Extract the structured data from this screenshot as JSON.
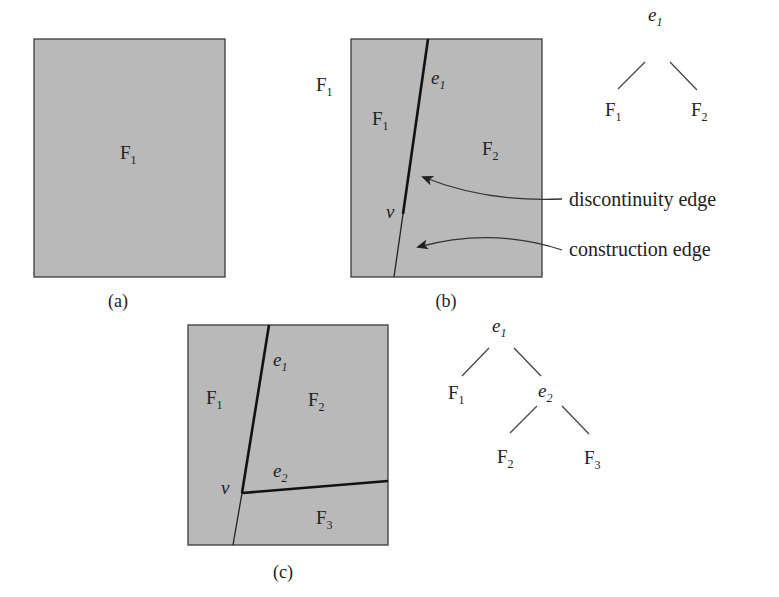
{
  "panels": {
    "a": {
      "caption": "(a)",
      "faces": [
        {
          "name": "F",
          "sub": "1"
        }
      ]
    },
    "b": {
      "caption": "(b)",
      "outside_label": {
        "name": "F",
        "sub": "1"
      },
      "faces": [
        {
          "name": "F",
          "sub": "1"
        },
        {
          "name": "F",
          "sub": "2"
        }
      ],
      "edge_label": {
        "name": "e",
        "sub": "1"
      },
      "vertex_label": "v",
      "annotations": {
        "discontinuity": "discontinuity edge",
        "construction": "construction edge"
      },
      "tree": {
        "root": {
          "name": "e",
          "sub": "1"
        },
        "left": {
          "name": "F",
          "sub": "1"
        },
        "right": {
          "name": "F",
          "sub": "2"
        }
      }
    },
    "c": {
      "caption": "(c)",
      "faces": [
        {
          "name": "F",
          "sub": "1"
        },
        {
          "name": "F",
          "sub": "2"
        },
        {
          "name": "F",
          "sub": "3"
        }
      ],
      "edge_labels": [
        {
          "name": "e",
          "sub": "1"
        },
        {
          "name": "e",
          "sub": "2"
        }
      ],
      "vertex_label": "v",
      "tree": {
        "root": {
          "name": "e",
          "sub": "1"
        },
        "left": {
          "name": "F",
          "sub": "1"
        },
        "right": {
          "name": "e",
          "sub": "2"
        },
        "right_left": {
          "name": "F",
          "sub": "2"
        },
        "right_right": {
          "name": "F",
          "sub": "3"
        }
      }
    }
  },
  "colors": {
    "face_fill": "#b9b9b9",
    "stroke": "#222222"
  }
}
